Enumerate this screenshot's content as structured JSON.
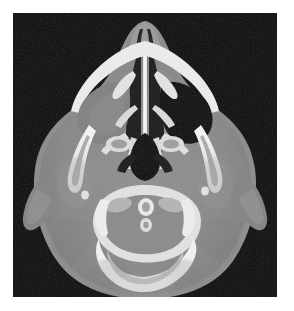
{
  "page": {
    "background_color": "#ffffff",
    "width": 294,
    "height": 311
  },
  "scan": {
    "modality": "CT",
    "plane": "axial",
    "region": "head",
    "level_description": "Axial CT of the head at the level of the maxillary sinuses and C1 vertebra",
    "frame": {
      "x": 13,
      "y": 13,
      "width": 264,
      "height": 284,
      "background_color": "#0b0b0b"
    },
    "window": {
      "type": "bone",
      "air_color": "#101010",
      "soft_tissue_color": "#8a8a8a",
      "fat_color": "#6f6f6f",
      "cortical_bone_color": "#f2f2f2",
      "trabecular_bone_color": "#bdbdbd",
      "calcification_color": "#fafafa"
    },
    "findings": [
      {
        "name": "nasal-septum",
        "description": "Midline vertical bony septum separating the nasal cavities"
      },
      {
        "name": "nasal-turbinates",
        "description": "Thin scrolled bony turbinates within both nasal cavities"
      },
      {
        "name": "right-maxillary-sinus",
        "description": "Air-filled, lucent (normal aeration)",
        "aeration": "aerated"
      },
      {
        "name": "left-maxillary-sinus",
        "description": "Opacified with soft tissue density",
        "aeration": "opacified"
      },
      {
        "name": "zygomatic-arch-left",
        "description": "Bright curved cortical bone strut lateral to the face"
      },
      {
        "name": "zygomatic-arch-right",
        "description": "Bright curved cortical bone strut lateral to the face"
      },
      {
        "name": "nasopharyngeal-airway",
        "description": "Dark midline air space posterior to the nasal cavity"
      },
      {
        "name": "c1-atlas-ring",
        "description": "Dense bony ring of the first cervical vertebra"
      },
      {
        "name": "dens-of-c2",
        "description": "Central rounded odontoid process within the C1 ring"
      },
      {
        "name": "styloid-process-right",
        "description": "Small bright calcific focus lateral to the airway"
      },
      {
        "name": "styloid-process-left",
        "description": "Small bright calcific focus lateral to the airway"
      },
      {
        "name": "auricle-left",
        "description": "Soft tissue ear projecting laterally from the scalp"
      },
      {
        "name": "auricle-right",
        "description": "Soft tissue ear projecting laterally from the scalp"
      },
      {
        "name": "occipital-soft-tissue",
        "description": "Posterior scalp and muscular soft tissues"
      }
    ]
  }
}
